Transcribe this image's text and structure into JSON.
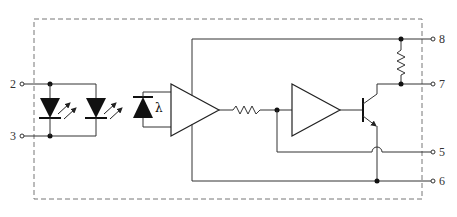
{
  "diagram": {
    "colors": {
      "line": "#333333",
      "border": "#777777",
      "fill": "#111111",
      "background": "#ffffff"
    },
    "pins": [
      {
        "id": "2",
        "label": "2",
        "side": "left"
      },
      {
        "id": "3",
        "label": "3",
        "side": "left"
      },
      {
        "id": "8",
        "label": "8",
        "side": "right"
      },
      {
        "id": "7",
        "label": "7",
        "side": "right"
      },
      {
        "id": "5",
        "label": "5",
        "side": "right"
      },
      {
        "id": "6",
        "label": "6",
        "side": "right"
      }
    ],
    "components": {
      "led1": "LED",
      "led2": "LED",
      "photodiode": "photodiode",
      "photodiode_symbol": "λ",
      "amp1": "amplifier",
      "resistor_series": "resistor",
      "amp2": "amplifier",
      "transistor": "NPN transistor",
      "resistor_pullup": "resistor"
    }
  }
}
